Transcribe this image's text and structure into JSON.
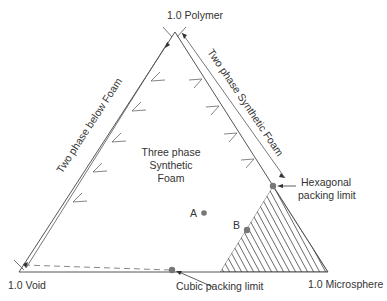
{
  "diagram": {
    "type": "ternary-phase-diagram",
    "vertices": {
      "top": "1.0 Polymer",
      "left": "1.0 Void",
      "right": "1.0 Microsphere"
    },
    "edge_labels": {
      "left": "Two phase below Foam",
      "right": "Two phase Synthetic Foam"
    },
    "region_label": {
      "line1": "Three phase",
      "line2": "Synthetic",
      "line3": "Foam"
    },
    "points": [
      {
        "label": "A"
      },
      {
        "label": "B"
      }
    ],
    "annotations": {
      "hexagonal": {
        "line1": "Hexagonal",
        "line2": "packing limit"
      },
      "cubic": "Cubic packing limit"
    },
    "colors": {
      "line": "#555555",
      "point": "#777777",
      "text": "#333333",
      "hatch": "#444444"
    }
  }
}
